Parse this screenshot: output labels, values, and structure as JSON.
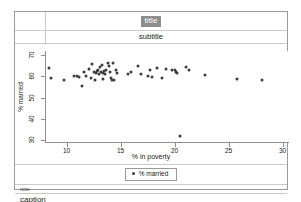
{
  "graph": {
    "title": "title",
    "subtitle": "subtitle",
    "note": "note",
    "caption": "caption",
    "title_highlight_color": "#8d8d8d",
    "marker_color": "#3c3c3c",
    "frame_color": "#9a9a9a"
  },
  "legend": {
    "entries": [
      {
        "label": "% married",
        "marker": "filled-circle",
        "color": "#3c3c3c"
      }
    ]
  },
  "chart_data": {
    "type": "scatter",
    "title": "title",
    "subtitle": "subtitle",
    "note": "note",
    "caption": "caption",
    "xlabel": "% in poverty",
    "ylabel": "% married",
    "xlim": [
      8,
      30.5
    ],
    "ylim": [
      29,
      72
    ],
    "xticks": [
      10,
      15,
      20,
      25,
      30
    ],
    "yticks": [
      30,
      40,
      50,
      60,
      70
    ],
    "grid": false,
    "legend_position": "bottom",
    "series": [
      {
        "name": "% married",
        "marker": "circle",
        "color": "#3c3c3c",
        "points": [
          [
            8.3,
            63.9
          ],
          [
            8.5,
            59.2
          ],
          [
            9.7,
            58.5
          ],
          [
            10.6,
            60.0
          ],
          [
            10.9,
            60.1
          ],
          [
            11.1,
            59.7
          ],
          [
            11.3,
            55.6
          ],
          [
            11.5,
            62.0
          ],
          [
            11.7,
            60.4
          ],
          [
            12.0,
            63.4
          ],
          [
            12.2,
            59.2
          ],
          [
            12.3,
            65.8
          ],
          [
            12.4,
            62.1
          ],
          [
            12.5,
            58.2
          ],
          [
            12.6,
            61.6
          ],
          [
            12.7,
            62.4
          ],
          [
            12.8,
            62.8
          ],
          [
            12.9,
            61.0
          ],
          [
            13.0,
            64.5
          ],
          [
            13.1,
            62.0
          ],
          [
            13.2,
            65.4
          ],
          [
            13.3,
            61.5
          ],
          [
            13.3,
            58.6
          ],
          [
            13.4,
            62.7
          ],
          [
            13.5,
            61.2
          ],
          [
            13.6,
            63.0
          ],
          [
            13.7,
            66.1
          ],
          [
            13.8,
            64.8
          ],
          [
            13.9,
            62.3
          ],
          [
            14.0,
            59.4
          ],
          [
            14.1,
            58.3
          ],
          [
            14.2,
            66.5
          ],
          [
            14.3,
            58.4
          ],
          [
            14.5,
            62.9
          ],
          [
            14.6,
            61.7
          ],
          [
            15.6,
            61.3
          ],
          [
            15.9,
            62.1
          ],
          [
            16.5,
            65.1
          ],
          [
            16.8,
            61.2
          ],
          [
            17.4,
            60.2
          ],
          [
            17.6,
            62.9
          ],
          [
            17.8,
            59.8
          ],
          [
            18.3,
            63.8
          ],
          [
            18.7,
            59.2
          ],
          [
            19.1,
            63.6
          ],
          [
            19.7,
            62.8
          ],
          [
            19.9,
            63.1
          ],
          [
            20.0,
            62.0
          ],
          [
            20.1,
            61.4
          ],
          [
            20.4,
            32.0
          ],
          [
            21.0,
            64.5
          ],
          [
            21.2,
            63.1
          ],
          [
            22.7,
            60.8
          ],
          [
            25.7,
            58.6
          ],
          [
            28.0,
            58.5
          ]
        ]
      }
    ]
  }
}
